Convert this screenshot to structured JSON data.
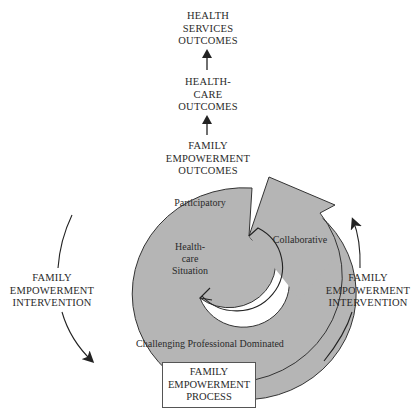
{
  "outcomes": {
    "health_services": "HEALTH\nSERVICES\nOUTCOMES",
    "health_care": "HEALTH-\nCARE\nOUTCOMES",
    "family_empowerment": "FAMILY\nEMPOWERMENT\nOUTCOMES"
  },
  "spiral": {
    "stage_participatory": "Participatory",
    "stage_collaborative": "Collaborative",
    "stage_challenging": "Challenging Professional Dominated",
    "center_label": "Health-\ncare\nSituation",
    "fill_color": "#b5b5b5"
  },
  "interventions": {
    "left": "FAMILY\nEMPOWERMENT\nINTERVENTION",
    "right": "FAMILY\nEMPOWERMENT\nINTERVENTION"
  },
  "process_box": {
    "label": "FAMILY\nEMPOWERMENT\nPROCESS"
  }
}
